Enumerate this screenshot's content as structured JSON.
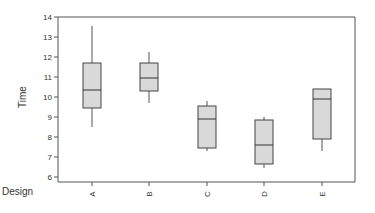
{
  "chart_data": {
    "type": "box",
    "title": "",
    "xlabel": "Design",
    "ylabel": "Time",
    "ylim": [
      6,
      14
    ],
    "yticks": [
      6,
      7,
      8,
      9,
      10,
      11,
      12,
      13,
      14
    ],
    "categories": [
      "A",
      "B",
      "C",
      "D",
      "E"
    ],
    "grid": false,
    "legend": null,
    "box_fill": "#d9d9d9",
    "box_stroke": "#444444",
    "series": [
      {
        "name": "A",
        "whisker_low": 8.5,
        "q1": 9.45,
        "median": 10.35,
        "q3": 11.7,
        "whisker_high": 13.55
      },
      {
        "name": "B",
        "whisker_low": 9.7,
        "q1": 10.3,
        "median": 10.95,
        "q3": 11.7,
        "whisker_high": 12.25
      },
      {
        "name": "C",
        "whisker_low": 7.3,
        "q1": 7.45,
        "median": 8.9,
        "q3": 9.55,
        "whisker_high": 9.8
      },
      {
        "name": "D",
        "whisker_low": 6.45,
        "q1": 6.65,
        "median": 7.6,
        "q3": 8.85,
        "whisker_high": 9.0
      },
      {
        "name": "E",
        "whisker_low": 7.3,
        "q1": 7.9,
        "median": 9.9,
        "q3": 10.4,
        "whisker_high": 10.4
      }
    ]
  }
}
